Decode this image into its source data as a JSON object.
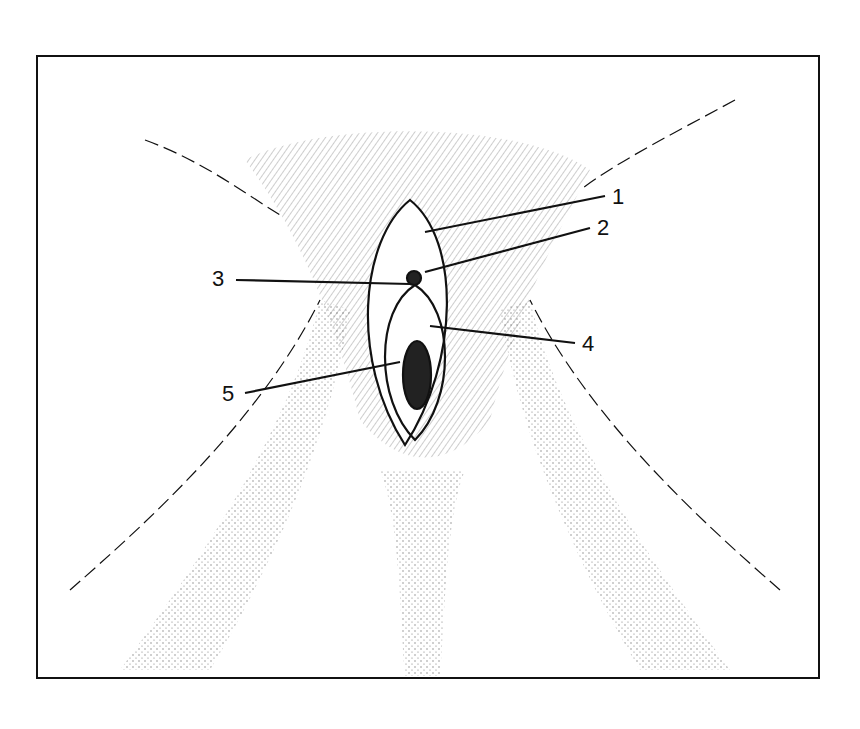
{
  "figure": {
    "type": "anatomical line drawing",
    "style": "black-and-white stipple illustration, simplified",
    "ink_color": "#111111",
    "background": "#ffffff"
  },
  "labels": [
    {
      "id": "1",
      "text": "1",
      "x": 612,
      "y": 186
    },
    {
      "id": "2",
      "text": "2",
      "x": 597,
      "y": 217
    },
    {
      "id": "3",
      "text": "3",
      "x": 212,
      "y": 268
    },
    {
      "id": "4",
      "text": "4",
      "x": 582,
      "y": 333
    },
    {
      "id": "5",
      "text": "5",
      "x": 222,
      "y": 383
    }
  ]
}
